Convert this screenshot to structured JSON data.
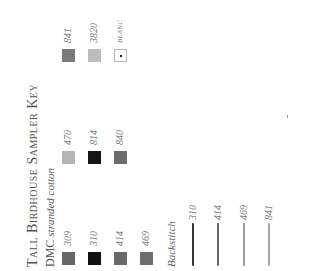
{
  "key": {
    "title": "Tall Birdhouse Sampler Key",
    "subtitle_brand": "DMC",
    "subtitle_rest": "stranded cotton",
    "swatches": [
      {
        "code": "309",
        "color": "#666666"
      },
      {
        "code": "310",
        "color": "#111111"
      },
      {
        "code": "414",
        "color": "#6a6a6a"
      },
      {
        "code": "469",
        "color": "#6e6e6e"
      },
      {
        "code": "470",
        "color": "#b4b4b4"
      },
      {
        "code": "814",
        "color": "#151515"
      },
      {
        "code": "840",
        "color": "#6c6c6c"
      },
      {
        "code": "841",
        "color": "#7a7a7a"
      },
      {
        "code": "3820",
        "color": "#bdbdbd"
      },
      {
        "code": "BLANC",
        "color": "#ffffff"
      }
    ],
    "backstitch": {
      "label": "Backstitch",
      "lines": [
        {
          "code": "310",
          "color": "#333333"
        },
        {
          "code": "414",
          "color": "#666666"
        },
        {
          "code": "469",
          "color": "#999999"
        },
        {
          "code": "841",
          "color": "#a8a8a8"
        }
      ]
    }
  }
}
